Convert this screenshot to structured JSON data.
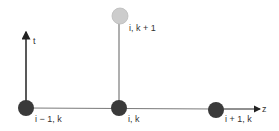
{
  "diagram": {
    "type": "finite-difference stencil",
    "axes": {
      "vertical": {
        "label": "t"
      },
      "horizontal": {
        "label": "z"
      }
    },
    "nodes": [
      {
        "id": "left",
        "label": "i − 1, k",
        "style": "dark"
      },
      {
        "id": "center",
        "label": "i, k",
        "style": "dark"
      },
      {
        "id": "right",
        "label": "i + 1, k",
        "style": "dark"
      },
      {
        "id": "top",
        "label": "i, k + 1",
        "style": "light"
      }
    ],
    "colors": {
      "dark_node": "#3a3a3a",
      "light_node": "#cccccc",
      "line": "#7a7a7a",
      "axis": "#222222"
    }
  }
}
